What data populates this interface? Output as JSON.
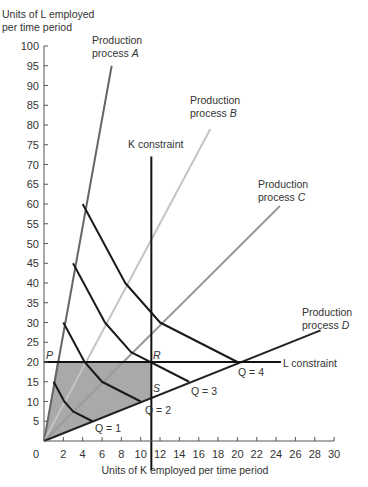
{
  "chart_data": {
    "type": "line",
    "title": "",
    "xlabel": "Units of K employed per time period",
    "ylabel": "Units of L employed per time period",
    "ylabel_lines": [
      "Units of L employed",
      "per time period"
    ],
    "xlim": [
      0,
      30
    ],
    "ylim": [
      0,
      100
    ],
    "x_ticks": [
      0,
      2,
      4,
      6,
      8,
      10,
      12,
      14,
      16,
      18,
      20,
      22,
      24,
      26,
      28,
      30
    ],
    "y_ticks": [
      5,
      10,
      15,
      20,
      25,
      30,
      35,
      40,
      45,
      50,
      55,
      60,
      65,
      70,
      75,
      80,
      85,
      90,
      95,
      100
    ],
    "grid": false,
    "processes": [
      {
        "name": "Production process A",
        "line1": "Production",
        "line2": "process",
        "letter": "A",
        "color": "#666666",
        "end": [
          7,
          95
        ]
      },
      {
        "name": "Production process B",
        "line1": "Production",
        "line2": "process",
        "letter": "B",
        "color": "#c4c4c4",
        "end": [
          17.2,
          79
        ]
      },
      {
        "name": "Production process C",
        "line1": "Production",
        "line2": "process",
        "letter": "C",
        "color": "#9a9a9a",
        "end": [
          24.4,
          59.5
        ]
      },
      {
        "name": "Production process D",
        "line1": "Production",
        "line2": "process",
        "letter": "D",
        "color": "#222222",
        "end": [
          28.6,
          28
        ]
      }
    ],
    "isoquants": [
      {
        "label": "Q = 1",
        "points": [
          [
            1,
            15
          ],
          [
            2.1,
            10
          ],
          [
            3,
            7.5
          ],
          [
            5,
            5
          ]
        ]
      },
      {
        "label": "Q = 2",
        "points": [
          [
            2,
            30
          ],
          [
            4.2,
            20
          ],
          [
            6,
            15
          ],
          [
            10,
            10
          ]
        ]
      },
      {
        "label": "Q = 3",
        "points": [
          [
            3,
            45
          ],
          [
            6.3,
            30
          ],
          [
            9,
            22.5
          ],
          [
            15,
            15
          ]
        ]
      },
      {
        "label": "Q = 4",
        "points": [
          [
            4,
            60
          ],
          [
            8.4,
            40
          ],
          [
            12,
            30
          ],
          [
            20,
            20
          ]
        ]
      }
    ],
    "constraints": {
      "K": {
        "label": "K constraint",
        "value": 11.1,
        "ymax": 72
      },
      "L": {
        "label": "L constraint",
        "value": 20,
        "xmax": 24.5
      }
    },
    "points": {
      "P": {
        "label": "P",
        "xy": [
          0,
          20
        ]
      },
      "R": {
        "label": "R",
        "xy": [
          11.1,
          20
        ]
      },
      "S": {
        "label": "S",
        "xy": [
          11.1,
          11.1
        ]
      }
    },
    "feasible_region": [
      [
        0,
        0
      ],
      [
        1.33,
        20
      ],
      [
        11.1,
        20
      ],
      [
        11.1,
        11.1
      ]
    ],
    "feasible_region_color": "#a9a9a9"
  }
}
